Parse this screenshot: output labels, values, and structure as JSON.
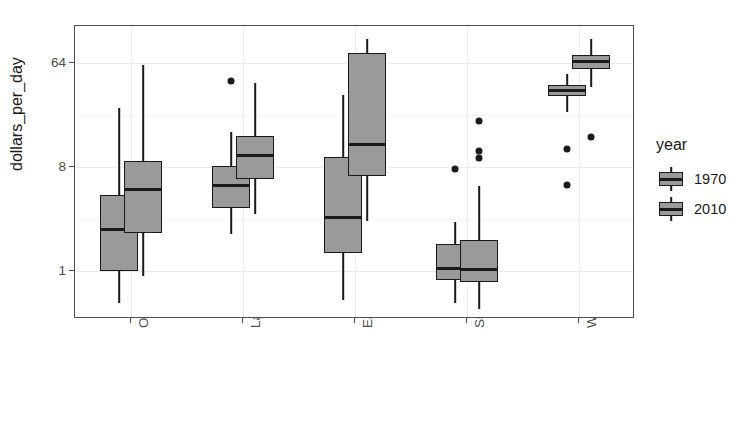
{
  "chart_data": {
    "type": "boxplot",
    "title": "",
    "xlabel": "",
    "ylabel": "dollars_per_day",
    "y_scale": "log2",
    "y_ticks": [
      1,
      8,
      64
    ],
    "y_tick_labels": [
      "1",
      "8",
      "64"
    ],
    "ylim": [
      0.38,
      135
    ],
    "grid": true,
    "legend": {
      "title": "year",
      "position": "right",
      "entries": [
        "1970",
        "2010"
      ]
    },
    "categories": [
      "Others",
      "Latin America",
      "East Asia",
      "Sub-Saharan",
      "West"
    ],
    "box_fill": "#9a9a9a",
    "box_line": "#1a1a1a",
    "series": [
      {
        "name": "1970",
        "boxes": [
          {
            "category": "Others",
            "lower_whisker": 0.52,
            "q1": 1.0,
            "median": 2.3,
            "q3": 4.6,
            "upper_whisker": 26.0,
            "outliers": []
          },
          {
            "category": "Latin America",
            "lower_whisker": 2.1,
            "q1": 3.55,
            "median": 5.5,
            "q3": 8.2,
            "upper_whisker": 16.0,
            "outliers": [
              45.0
            ]
          },
          {
            "category": "East Asia",
            "lower_whisker": 0.56,
            "q1": 1.42,
            "median": 2.9,
            "q3": 9.8,
            "upper_whisker": 34.0,
            "outliers": []
          },
          {
            "category": "Sub-Saharan",
            "lower_whisker": 0.52,
            "q1": 0.83,
            "median": 1.05,
            "q3": 1.7,
            "upper_whisker": 2.65,
            "outliers": [
              7.7
            ]
          },
          {
            "category": "West",
            "lower_whisker": 24.0,
            "q1": 33.0,
            "median": 37.0,
            "q3": 41.0,
            "upper_whisker": 52.0,
            "outliers": [
              11.5,
              5.6
            ]
          }
        ]
      },
      {
        "name": "2010",
        "boxes": [
          {
            "category": "Others",
            "lower_whisker": 0.9,
            "q1": 2.15,
            "median": 5.1,
            "q3": 9.1,
            "upper_whisker": 62.0,
            "outliers": []
          },
          {
            "category": "Latin America",
            "lower_whisker": 3.1,
            "q1": 6.3,
            "median": 10.0,
            "q3": 15.0,
            "upper_whisker": 43.0,
            "outliers": []
          },
          {
            "category": "East Asia",
            "lower_whisker": 2.7,
            "q1": 6.7,
            "median": 12.5,
            "q3": 78.0,
            "upper_whisker": 105.0,
            "outliers": []
          },
          {
            "category": "Sub-Saharan",
            "lower_whisker": 0.46,
            "q1": 0.8,
            "median": 1.02,
            "q3": 1.85,
            "upper_whisker": 5.5,
            "outliers": [
              20.0,
              11.0,
              9.6
            ]
          },
          {
            "category": "West",
            "lower_whisker": 40.0,
            "q1": 57.0,
            "median": 66.0,
            "q3": 76.0,
            "upper_whisker": 105.0,
            "outliers": [
              14.5
            ]
          }
        ]
      }
    ]
  }
}
